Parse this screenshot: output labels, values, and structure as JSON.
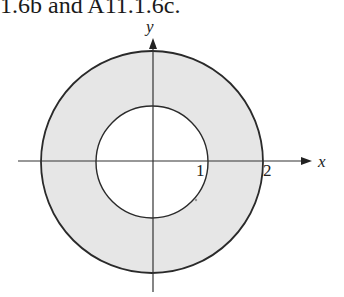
{
  "caption": "1.6b and A11.1.6c.",
  "diagram": {
    "type": "annulus-region",
    "axes": {
      "x_label": "x",
      "y_label": "y"
    },
    "tick_labels": {
      "inner_radius": "1",
      "outer_radius": "2"
    },
    "circles": [
      {
        "name": "inner",
        "radius": 1
      },
      {
        "name": "outer",
        "radius": 2
      }
    ],
    "shaded_region": "1 ≤ x² + y² ≤ 4",
    "colors": {
      "fill": "#e6e6e6",
      "stroke": "#2a2a2a",
      "axis": "#333333"
    }
  }
}
